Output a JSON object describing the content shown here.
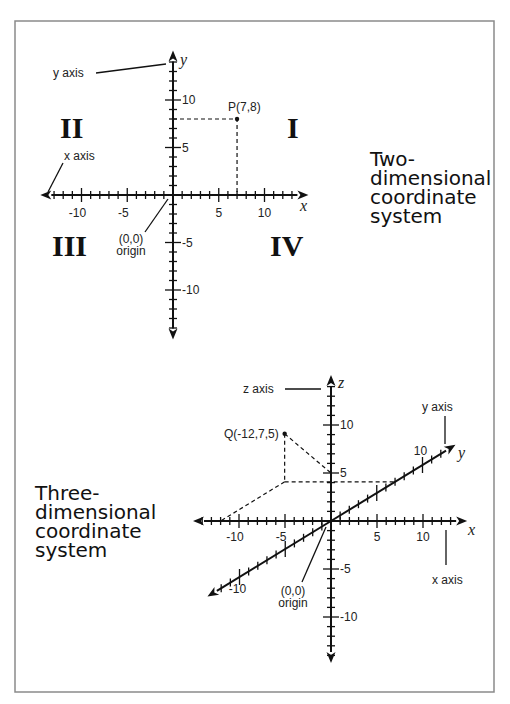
{
  "frame": {
    "x": 15,
    "y": 21,
    "w": 479,
    "h": 671,
    "color": "#8a8a8a"
  },
  "two_d": {
    "title_lines": [
      "Two-",
      "dimensional",
      "coordinate",
      "system"
    ],
    "title_pos": {
      "x": 370,
      "y": 166
    },
    "origin": {
      "x": 173,
      "y": 195
    },
    "unit_x": 9.15,
    "unit_y": 9.5,
    "x_range": [
      -14.5,
      14.8
    ],
    "y_range": [
      -15.2,
      15.2
    ],
    "x_tick_labels": [
      {
        "v": -10,
        "text": "-10"
      },
      {
        "v": -5,
        "text": "-5"
      },
      {
        "v": 5,
        "text": "5"
      },
      {
        "v": 10,
        "text": "10"
      }
    ],
    "y_tick_labels": [
      {
        "v": 10,
        "text": "10"
      },
      {
        "v": 5,
        "text": "5"
      },
      {
        "v": -5,
        "text": "-5"
      },
      {
        "v": -10,
        "text": "-10"
      }
    ],
    "x_var": "x",
    "y_var": "y",
    "point": {
      "x": 7,
      "y": 8,
      "label": "P(7,8)"
    },
    "quadrants": [
      {
        "label": "I",
        "x": 287,
        "y": 138
      },
      {
        "label": "II",
        "x": 60,
        "y": 138
      },
      {
        "label": "III",
        "x": 52,
        "y": 256
      },
      {
        "label": "IV",
        "x": 270,
        "y": 256
      }
    ],
    "annotations": {
      "y_axis_label": "y axis",
      "x_axis_label": "x axis",
      "origin_coords": "(0,0)",
      "origin_label": "origin"
    }
  },
  "three_d": {
    "title_lines": [
      "Three-",
      "dimensional",
      "coordinate",
      "system"
    ],
    "title_pos": {
      "x": 35,
      "y": 500
    },
    "origin": {
      "x": 331,
      "y": 521
    },
    "unit_x": 9.2,
    "unit_z": 9.6,
    "y_dir": {
      "dx": 9.15,
      "dy": -5.6
    },
    "x_range": [
      -15,
      14.8
    ],
    "z_range": [
      -14.8,
      15.2
    ],
    "y_range": [
      -13.5,
      13.6
    ],
    "x_tick_labels": [
      {
        "v": -10,
        "text": "-10"
      },
      {
        "v": -5,
        "text": "-5"
      },
      {
        "v": 5,
        "text": "5"
      },
      {
        "v": 10,
        "text": "10"
      }
    ],
    "z_tick_labels": [
      {
        "v": 10,
        "text": "10"
      },
      {
        "v": 5,
        "text": "5"
      },
      {
        "v": -5,
        "text": "-5"
      },
      {
        "v": -10,
        "text": "-10"
      }
    ],
    "y_tick_labels": [
      {
        "v": 10,
        "text": "10"
      },
      {
        "v": -10,
        "text": "-10"
      }
    ],
    "x_var": "x",
    "y_var": "y",
    "z_var": "z",
    "point": {
      "x": -12,
      "y": 7,
      "z": 5,
      "label": "Q(-12,7,5)"
    },
    "annotations": {
      "z_axis_label": "z axis",
      "y_axis_label": "y axis",
      "x_axis_label": "x axis",
      "origin_coords": "(0,0)",
      "origin_label": "origin"
    }
  }
}
